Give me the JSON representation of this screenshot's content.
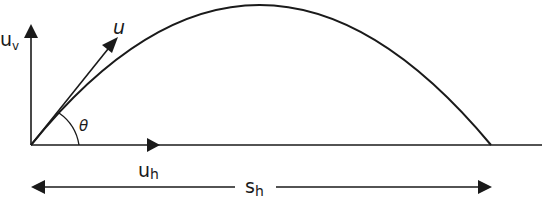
{
  "diagram": {
    "type": "projectile-motion",
    "colors": {
      "stroke": "#1a1a1a",
      "background": "#ffffff"
    },
    "labels": {
      "vertical_velocity": {
        "main": "u",
        "sub": "v"
      },
      "initial_velocity": "u",
      "angle": "θ",
      "horizontal_velocity": {
        "main": "u",
        "sub": "h"
      },
      "horizontal_range": {
        "main": "s",
        "sub": "h"
      }
    }
  }
}
